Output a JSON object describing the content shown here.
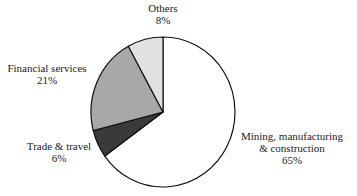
{
  "chart_data": {
    "type": "pie",
    "title": "",
    "start_angle_deg": 90,
    "direction": "clockwise",
    "slices": [
      {
        "label": "Mining, manufacturing & construction",
        "value": 65,
        "value_label": "65%",
        "color": "#ffffff"
      },
      {
        "label": "Trade & travel",
        "value": 6,
        "value_label": "6%",
        "color": "#3a3a3a"
      },
      {
        "label": "Financial services",
        "value": 21,
        "value_label": "21%",
        "color": "#a8a8a8"
      },
      {
        "label": "Others",
        "value": 8,
        "value_label": "8%",
        "color": "#e2e2e2"
      }
    ],
    "legend": "none (direct labels)"
  },
  "labels": {
    "mining": {
      "line1": "Mining, manufacturing",
      "line2": "& construction",
      "pct": "65%"
    },
    "trade": {
      "line1": "Trade & travel",
      "pct": "6%"
    },
    "financial": {
      "line1": "Financial services",
      "pct": "21%"
    },
    "others": {
      "line1": "Others",
      "pct": "8%"
    }
  }
}
